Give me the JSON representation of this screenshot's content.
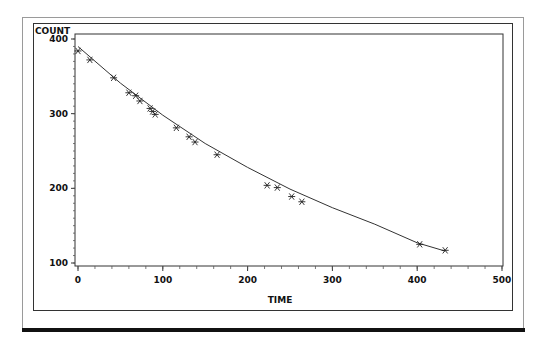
{
  "chart_data": {
    "type": "scatter",
    "title": "",
    "xlabel": "TIME",
    "ylabel": "COUNT",
    "xlim": [
      0,
      500
    ],
    "ylim": [
      100,
      400
    ],
    "x_ticks": [
      "0",
      "100",
      "200",
      "300",
      "400",
      "500"
    ],
    "y_ticks": [
      "100",
      "200",
      "300",
      "400"
    ],
    "grid": false,
    "legend": null,
    "marker": "asterisk",
    "series": [
      {
        "name": "observed",
        "type": "scatter",
        "x": [
          0,
          14,
          42,
          60,
          68,
          73,
          85,
          88,
          91,
          116,
          131,
          138,
          164,
          223,
          235,
          252,
          264,
          403,
          433
        ],
        "y": [
          384,
          372,
          348,
          328,
          324,
          317,
          307,
          303,
          299,
          281,
          269,
          262,
          245,
          204,
          201,
          189,
          182,
          125,
          117
        ]
      },
      {
        "name": "fitted curve",
        "type": "line",
        "x": [
          0,
          50,
          100,
          150,
          200,
          250,
          300,
          350,
          400,
          433
        ],
        "y": [
          390,
          341,
          298,
          260,
          228,
          199,
          174,
          152,
          127,
          116
        ]
      }
    ]
  }
}
